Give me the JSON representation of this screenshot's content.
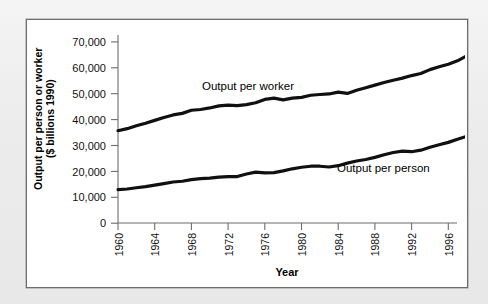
{
  "figure": {
    "background_color": "#ffffff",
    "frame_color": "#6d6d6d",
    "line_color": "#101010"
  },
  "axes": {
    "y_title_line1": "Output per person or worker",
    "y_title_line2": "($ billions 1990)",
    "x_title": "Year",
    "y_tick_labels": [
      "70,000",
      "60,000",
      "50,000",
      "40,000",
      "30,000",
      "20,000",
      "10,000",
      "0"
    ],
    "x_tick_labels": [
      "1960",
      "1964",
      "1968",
      "1972",
      "1976",
      "1980",
      "1984",
      "1988",
      "1992",
      "1996"
    ]
  },
  "annotations": {
    "worker_label": "Output per worker",
    "person_label": "Output per person"
  },
  "chart_data": {
    "type": "line",
    "title": "",
    "subtitle": "",
    "xlabel": "Year",
    "ylabel": "Output per person or worker ($ billions 1990)",
    "xlim": [
      1960,
      1998
    ],
    "ylim": [
      0,
      70000
    ],
    "grid": false,
    "legend_position": "inline-annotation",
    "x": [
      1960,
      1961,
      1962,
      1963,
      1964,
      1965,
      1966,
      1967,
      1968,
      1969,
      1970,
      1971,
      1972,
      1973,
      1974,
      1975,
      1976,
      1977,
      1978,
      1979,
      1980,
      1981,
      1982,
      1983,
      1984,
      1985,
      1986,
      1987,
      1988,
      1989,
      1990,
      1991,
      1992,
      1993,
      1994,
      1995,
      1996,
      1997,
      1998
    ],
    "series": [
      {
        "name": "Output per worker",
        "values": [
          35700,
          36500,
          37600,
          38600,
          39700,
          40800,
          41800,
          42400,
          43600,
          43900,
          44500,
          45300,
          45600,
          45400,
          45800,
          46500,
          47800,
          48300,
          47600,
          48300,
          48600,
          49400,
          49700,
          49900,
          50600,
          50100,
          51300,
          52300,
          53300,
          54300,
          55200,
          56000,
          57000,
          57800,
          59300,
          60400,
          61400,
          62700,
          64600
        ]
      },
      {
        "name": "Output per person",
        "values": [
          13000,
          13200,
          13700,
          14100,
          14700,
          15300,
          15900,
          16200,
          16800,
          17200,
          17400,
          17800,
          18000,
          18000,
          19000,
          19700,
          19400,
          19500,
          20200,
          21000,
          21600,
          22000,
          22000,
          21700,
          22200,
          23200,
          24000,
          24600,
          25400,
          26400,
          27300,
          27800,
          27600,
          28200,
          29300,
          30300,
          31200,
          32400,
          33500
        ]
      }
    ]
  }
}
